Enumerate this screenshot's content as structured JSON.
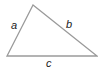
{
  "diagram": {
    "type": "triangle",
    "stroke_color": "#9a9a9a",
    "label_color": "#222222",
    "vertices": {
      "apex": [
        33,
        5
      ],
      "bottom_left": [
        7,
        56
      ],
      "bottom_right": [
        97,
        56
      ]
    },
    "sides": [
      {
        "id": "a",
        "label": "a",
        "from": "bottom_left",
        "to": "apex"
      },
      {
        "id": "b",
        "label": "b",
        "from": "apex",
        "to": "bottom_right"
      },
      {
        "id": "c",
        "label": "c",
        "from": "bottom_left",
        "to": "bottom_right"
      }
    ]
  }
}
